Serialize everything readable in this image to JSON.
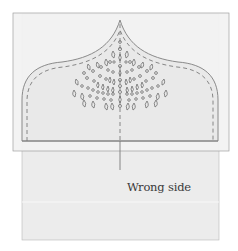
{
  "diagram": {
    "label": "Wrong side",
    "colors": {
      "background": "#ffffff",
      "lower_panel": "#ececec",
      "overlay_panel": "#f1f1f1",
      "shape_fill": "#e8e8e8",
      "outline": "#8a8a8a",
      "stitch": "#7a7a7a",
      "motif": "#6e6e6e"
    },
    "parts": [
      {
        "name": "fabric-wrong-side",
        "description": "lower fabric panel"
      },
      {
        "name": "facing-overlay",
        "description": "translucent facing rectangle"
      },
      {
        "name": "onion-dome-shape",
        "description": "pointed arch shape with dashed stitch line"
      },
      {
        "name": "embroidery-motif",
        "description": "teardrop and circle eyelet fan motif"
      },
      {
        "name": "center-line",
        "description": "vertical center fold line"
      }
    ]
  }
}
